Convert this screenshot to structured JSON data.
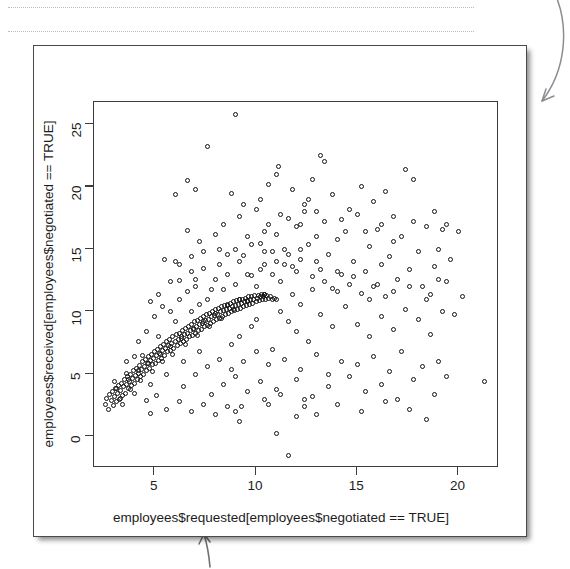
{
  "page": {
    "background": "#ffffff",
    "decorations": {
      "dotted_rules": 2,
      "arrow_top_right": "curved-arrow-pointing-down-left",
      "arrow_bottom": "arrow-pointing-up"
    }
  },
  "figure": {
    "card_border_color": "#4a4a4a",
    "plot_frame_color": "#3c3c3c",
    "point_color": "#111111"
  },
  "chart_data": {
    "type": "scatter",
    "title": "",
    "xlabel": "employees$requested[employees$negotiated == TRUE]",
    "ylabel": "employees$received[employees$negotiated == TRUE]",
    "grid": false,
    "legend": null,
    "xlim": [
      2.0,
      22.0
    ],
    "ylim": [
      -2.5,
      26.8
    ],
    "xticks": [
      5,
      10,
      15,
      20
    ],
    "yticks": [
      0,
      5,
      10,
      15,
      20,
      25
    ],
    "xtick_labels": [
      "5",
      "10",
      "15",
      "20"
    ],
    "ytick_labels": [
      "0",
      "5",
      "10",
      "15",
      "20",
      "25"
    ],
    "marker": "open-circle",
    "marker_size_px": 5,
    "n_points": 430,
    "points": [
      [
        2.55,
        2.6
      ],
      [
        2.62,
        3.1
      ],
      [
        2.7,
        2.2
      ],
      [
        2.78,
        3.4
      ],
      [
        2.85,
        2.9
      ],
      [
        2.9,
        3.6
      ],
      [
        2.95,
        2.5
      ],
      [
        3.0,
        3.2
      ],
      [
        3.05,
        3.9
      ],
      [
        3.1,
        2.8
      ],
      [
        3.15,
        3.5
      ],
      [
        3.2,
        4.1
      ],
      [
        3.25,
        3.0
      ],
      [
        3.3,
        3.7
      ],
      [
        3.35,
        4.3
      ],
      [
        3.4,
        3.3
      ],
      [
        3.45,
        4.0
      ],
      [
        3.5,
        4.6
      ],
      [
        3.55,
        3.5
      ],
      [
        3.6,
        4.2
      ],
      [
        3.65,
        4.8
      ],
      [
        3.7,
        3.9
      ],
      [
        3.75,
        4.4
      ],
      [
        3.8,
        5.0
      ],
      [
        3.85,
        4.1
      ],
      [
        3.9,
        4.7
      ],
      [
        3.95,
        5.3
      ],
      [
        4.0,
        4.3
      ],
      [
        4.05,
        4.9
      ],
      [
        4.1,
        5.5
      ],
      [
        4.15,
        4.6
      ],
      [
        4.2,
        5.1
      ],
      [
        4.25,
        5.7
      ],
      [
        4.3,
        4.8
      ],
      [
        4.35,
        5.4
      ],
      [
        4.4,
        6.0
      ],
      [
        4.45,
        5.0
      ],
      [
        4.5,
        5.6
      ],
      [
        4.55,
        6.2
      ],
      [
        4.6,
        5.3
      ],
      [
        4.65,
        5.9
      ],
      [
        4.7,
        6.4
      ],
      [
        4.75,
        5.5
      ],
      [
        4.8,
        6.1
      ],
      [
        4.85,
        6.6
      ],
      [
        4.9,
        5.8
      ],
      [
        4.95,
        6.3
      ],
      [
        5.0,
        6.8
      ],
      [
        5.05,
        5.9
      ],
      [
        5.1,
        6.5
      ],
      [
        5.15,
        7.0
      ],
      [
        5.2,
        6.1
      ],
      [
        5.25,
        6.7
      ],
      [
        5.3,
        7.2
      ],
      [
        5.35,
        6.3
      ],
      [
        5.4,
        6.9
      ],
      [
        5.45,
        7.4
      ],
      [
        5.5,
        6.5
      ],
      [
        5.55,
        7.1
      ],
      [
        5.6,
        7.6
      ],
      [
        5.65,
        6.8
      ],
      [
        5.7,
        7.3
      ],
      [
        5.75,
        7.8
      ],
      [
        5.8,
        6.9
      ],
      [
        5.85,
        7.5
      ],
      [
        5.9,
        8.0
      ],
      [
        5.95,
        7.1
      ],
      [
        6.0,
        7.6
      ],
      [
        6.05,
        8.2
      ],
      [
        6.1,
        7.3
      ],
      [
        6.15,
        7.8
      ],
      [
        6.2,
        8.3
      ],
      [
        6.25,
        7.5
      ],
      [
        6.3,
        8.0
      ],
      [
        6.35,
        8.5
      ],
      [
        6.4,
        7.6
      ],
      [
        6.45,
        8.2
      ],
      [
        6.5,
        8.7
      ],
      [
        6.55,
        7.8
      ],
      [
        6.6,
        8.3
      ],
      [
        6.65,
        8.8
      ],
      [
        6.7,
        8.0
      ],
      [
        6.75,
        8.5
      ],
      [
        6.8,
        9.0
      ],
      [
        6.85,
        8.1
      ],
      [
        6.9,
        8.7
      ],
      [
        6.95,
        9.2
      ],
      [
        7.0,
        8.3
      ],
      [
        7.05,
        8.8
      ],
      [
        7.1,
        9.3
      ],
      [
        7.15,
        8.5
      ],
      [
        7.2,
        9.0
      ],
      [
        7.25,
        9.5
      ],
      [
        7.3,
        8.6
      ],
      [
        7.35,
        9.1
      ],
      [
        7.4,
        9.6
      ],
      [
        7.45,
        8.8
      ],
      [
        7.5,
        9.3
      ],
      [
        7.55,
        9.8
      ],
      [
        7.6,
        8.9
      ],
      [
        7.65,
        9.4
      ],
      [
        7.7,
        9.9
      ],
      [
        7.75,
        9.1
      ],
      [
        7.8,
        9.6
      ],
      [
        7.85,
        10.0
      ],
      [
        7.9,
        9.2
      ],
      [
        7.95,
        9.7
      ],
      [
        8.0,
        10.2
      ],
      [
        8.05,
        9.4
      ],
      [
        8.1,
        9.8
      ],
      [
        8.15,
        10.3
      ],
      [
        8.2,
        9.5
      ],
      [
        8.25,
        10.0
      ],
      [
        8.3,
        10.4
      ],
      [
        8.35,
        9.6
      ],
      [
        8.4,
        10.1
      ],
      [
        8.45,
        10.5
      ],
      [
        8.5,
        9.8
      ],
      [
        8.55,
        10.2
      ],
      [
        8.6,
        10.6
      ],
      [
        8.65,
        9.9
      ],
      [
        8.7,
        10.3
      ],
      [
        8.75,
        10.7
      ],
      [
        8.8,
        10.0
      ],
      [
        8.85,
        10.4
      ],
      [
        8.9,
        10.8
      ],
      [
        8.95,
        10.1
      ],
      [
        9.0,
        10.5
      ],
      [
        9.05,
        10.9
      ],
      [
        9.1,
        10.2
      ],
      [
        9.15,
        10.6
      ],
      [
        9.2,
        11.0
      ],
      [
        9.25,
        10.3
      ],
      [
        9.3,
        10.7
      ],
      [
        9.35,
        11.0
      ],
      [
        9.4,
        10.4
      ],
      [
        9.45,
        10.8
      ],
      [
        9.5,
        11.1
      ],
      [
        9.55,
        10.5
      ],
      [
        9.6,
        10.9
      ],
      [
        9.65,
        11.2
      ],
      [
        9.7,
        10.6
      ],
      [
        9.75,
        11.0
      ],
      [
        9.8,
        11.2
      ],
      [
        9.85,
        10.7
      ],
      [
        9.9,
        11.0
      ],
      [
        9.95,
        11.3
      ],
      [
        10.0,
        10.8
      ],
      [
        10.05,
        11.1
      ],
      [
        10.1,
        11.3
      ],
      [
        10.15,
        10.9
      ],
      [
        10.2,
        11.2
      ],
      [
        10.25,
        11.4
      ],
      [
        10.3,
        11.0
      ],
      [
        10.35,
        11.2
      ],
      [
        10.4,
        11.4
      ],
      [
        10.45,
        11.0
      ],
      [
        10.5,
        11.3
      ],
      [
        10.6,
        11.1
      ],
      [
        10.7,
        11.2
      ],
      [
        10.8,
        11.0
      ],
      [
        10.9,
        11.1
      ],
      [
        11.0,
        11.0
      ],
      [
        3.0,
        4.4
      ],
      [
        3.4,
        2.6
      ],
      [
        3.6,
        5.1
      ],
      [
        4.0,
        3.5
      ],
      [
        4.4,
        6.5
      ],
      [
        4.8,
        4.2
      ],
      [
        5.2,
        8.0
      ],
      [
        5.6,
        5.0
      ],
      [
        6.0,
        9.2
      ],
      [
        6.4,
        6.0
      ],
      [
        6.8,
        10.0
      ],
      [
        7.2,
        6.8
      ],
      [
        3.3,
        3.1
      ],
      [
        3.8,
        3.8
      ],
      [
        4.3,
        4.5
      ],
      [
        4.9,
        5.2
      ],
      [
        5.4,
        6.0
      ],
      [
        5.9,
        6.6
      ],
      [
        6.5,
        7.4
      ],
      [
        7.1,
        8.1
      ],
      [
        7.7,
        8.8
      ],
      [
        8.3,
        9.5
      ],
      [
        8.9,
        10.2
      ],
      [
        9.6,
        10.8
      ],
      [
        3.1,
        3.9
      ],
      [
        3.7,
        4.6
      ],
      [
        4.2,
        5.3
      ],
      [
        4.7,
        5.9
      ],
      [
        5.3,
        6.6
      ],
      [
        5.8,
        7.2
      ],
      [
        6.3,
        7.9
      ],
      [
        6.9,
        8.6
      ],
      [
        7.4,
        9.2
      ],
      [
        8.0,
        9.9
      ],
      [
        8.6,
        10.5
      ],
      [
        9.2,
        11.0
      ],
      [
        4.6,
        2.9
      ],
      [
        5.1,
        3.3
      ],
      [
        9.0,
        2.0
      ],
      [
        9.3,
        2.4
      ],
      [
        11.0,
        0.3
      ],
      [
        11.6,
        -1.5
      ],
      [
        12.0,
        1.6
      ],
      [
        10.6,
        2.6
      ],
      [
        11.2,
        3.4
      ],
      [
        12.4,
        3.0
      ],
      [
        4.8,
        1.9
      ],
      [
        5.5,
        14.2
      ],
      [
        6.2,
        12.5
      ],
      [
        6.0,
        14.0
      ],
      [
        6.6,
        16.5
      ],
      [
        7.0,
        12.0
      ],
      [
        7.4,
        13.5
      ],
      [
        7.8,
        11.8
      ],
      [
        8.2,
        15.0
      ],
      [
        8.6,
        13.0
      ],
      [
        9.0,
        25.8
      ],
      [
        9.2,
        17.6
      ],
      [
        9.4,
        14.5
      ],
      [
        8.8,
        19.5
      ],
      [
        9.6,
        16.0
      ],
      [
        9.8,
        12.9
      ],
      [
        10.0,
        18.2
      ],
      [
        10.2,
        15.5
      ],
      [
        10.4,
        13.8
      ],
      [
        10.6,
        17.0
      ],
      [
        10.8,
        14.8
      ],
      [
        11.0,
        16.2
      ],
      [
        11.2,
        12.4
      ],
      [
        11.4,
        15.0
      ],
      [
        11.6,
        17.5
      ],
      [
        11.8,
        13.6
      ],
      [
        12.0,
        16.8
      ],
      [
        12.2,
        14.2
      ],
      [
        12.4,
        18.0
      ],
      [
        12.6,
        15.4
      ],
      [
        12.8,
        12.8
      ],
      [
        13.0,
        16.0
      ],
      [
        13.2,
        13.4
      ],
      [
        13.4,
        17.2
      ],
      [
        13.6,
        14.6
      ],
      [
        13.8,
        11.9
      ],
      [
        14.0,
        15.8
      ],
      [
        14.2,
        13.0
      ],
      [
        14.4,
        16.4
      ],
      [
        14.6,
        12.2
      ],
      [
        14.8,
        14.0
      ],
      [
        15.0,
        17.8
      ],
      [
        15.2,
        11.5
      ],
      [
        15.4,
        13.2
      ],
      [
        15.6,
        15.2
      ],
      [
        15.8,
        12.0
      ],
      [
        16.0,
        16.6
      ],
      [
        16.2,
        13.8
      ],
      [
        16.4,
        11.2
      ],
      [
        16.6,
        14.4
      ],
      [
        16.8,
        15.6
      ],
      [
        17.0,
        12.6
      ],
      [
        17.2,
        16.0
      ],
      [
        17.4,
        21.4
      ],
      [
        17.6,
        13.4
      ],
      [
        17.8,
        20.6
      ],
      [
        18.0,
        14.8
      ],
      [
        18.2,
        12.0
      ],
      [
        18.4,
        16.8
      ],
      [
        18.6,
        11.4
      ],
      [
        18.8,
        13.6
      ],
      [
        19.0,
        15.0
      ],
      [
        19.2,
        16.6
      ],
      [
        19.4,
        12.4
      ],
      [
        21.3,
        4.4
      ],
      [
        13.2,
        22.5
      ],
      [
        13.4,
        22.0
      ],
      [
        11.0,
        21.0
      ],
      [
        11.1,
        21.6
      ],
      [
        7.6,
        23.2
      ],
      [
        6.6,
        20.5
      ],
      [
        6.0,
        19.4
      ],
      [
        7.0,
        19.8
      ],
      [
        10.6,
        20.2
      ],
      [
        12.4,
        18.6
      ],
      [
        12.6,
        19.0
      ],
      [
        16.4,
        19.6
      ],
      [
        15.8,
        18.8
      ],
      [
        15.2,
        20.0
      ],
      [
        8.4,
        17.0
      ],
      [
        8.0,
        16.2
      ],
      [
        7.2,
        15.6
      ],
      [
        6.8,
        14.4
      ],
      [
        9.4,
        18.6
      ],
      [
        9.0,
        15.0
      ],
      [
        10.2,
        19.0
      ],
      [
        10.0,
        12.0
      ],
      [
        10.4,
        11.4
      ],
      [
        11.2,
        10.0
      ],
      [
        11.6,
        9.2
      ],
      [
        12.0,
        8.4
      ],
      [
        12.6,
        7.6
      ],
      [
        13.2,
        9.8
      ],
      [
        13.8,
        8.8
      ],
      [
        14.4,
        10.4
      ],
      [
        15.0,
        9.0
      ],
      [
        15.6,
        8.0
      ],
      [
        16.2,
        9.6
      ],
      [
        16.8,
        8.6
      ],
      [
        17.4,
        10.2
      ],
      [
        18.0,
        9.4
      ],
      [
        18.6,
        8.2
      ],
      [
        19.2,
        10.0
      ],
      [
        10.8,
        7.0
      ],
      [
        11.4,
        6.2
      ],
      [
        12.2,
        5.4
      ],
      [
        13.0,
        6.6
      ],
      [
        13.6,
        5.0
      ],
      [
        14.2,
        6.0
      ],
      [
        15.0,
        5.8
      ],
      [
        15.8,
        6.4
      ],
      [
        16.6,
        5.2
      ],
      [
        17.2,
        6.8
      ],
      [
        18.2,
        5.6
      ],
      [
        19.0,
        6.0
      ],
      [
        10.2,
        4.4
      ],
      [
        11.0,
        3.8
      ],
      [
        12.0,
        4.6
      ],
      [
        12.8,
        3.2
      ],
      [
        13.6,
        4.0
      ],
      [
        14.6,
        4.8
      ],
      [
        15.4,
        3.6
      ],
      [
        16.2,
        4.2
      ],
      [
        17.0,
        3.0
      ],
      [
        17.8,
        4.6
      ],
      [
        18.8,
        3.4
      ],
      [
        19.4,
        4.8
      ],
      [
        12.4,
        2.4
      ],
      [
        13.0,
        1.8
      ],
      [
        14.0,
        2.6
      ],
      [
        15.2,
        2.0
      ],
      [
        16.4,
        2.8
      ],
      [
        17.6,
        2.2
      ],
      [
        18.4,
        1.4
      ],
      [
        9.8,
        8.8
      ],
      [
        10.0,
        9.4
      ],
      [
        9.2,
        8.0
      ],
      [
        8.8,
        7.4
      ],
      [
        11.8,
        11.4
      ],
      [
        12.2,
        10.6
      ],
      [
        12.8,
        11.8
      ],
      [
        13.4,
        12.4
      ],
      [
        14.0,
        11.6
      ],
      [
        14.8,
        12.8
      ],
      [
        15.6,
        11.0
      ],
      [
        16.0,
        12.2
      ],
      [
        16.8,
        11.6
      ],
      [
        17.6,
        12.0
      ],
      [
        18.4,
        11.0
      ],
      [
        19.0,
        12.6
      ],
      [
        12.0,
        13.2
      ],
      [
        11.4,
        13.8
      ],
      [
        10.8,
        13.0
      ],
      [
        10.2,
        13.4
      ],
      [
        9.6,
        13.0
      ],
      [
        9.0,
        12.2
      ],
      [
        8.4,
        11.8
      ],
      [
        8.0,
        12.6
      ],
      [
        7.6,
        11.0
      ],
      [
        7.2,
        10.6
      ],
      [
        11.6,
        14.6
      ],
      [
        12.2,
        15.0
      ],
      [
        11.0,
        14.0
      ],
      [
        10.4,
        14.8
      ],
      [
        9.8,
        15.4
      ],
      [
        9.2,
        14.0
      ],
      [
        8.6,
        14.6
      ],
      [
        8.2,
        13.8
      ],
      [
        13.0,
        14.0
      ],
      [
        14.0,
        13.2
      ],
      [
        5.0,
        9.6
      ],
      [
        5.4,
        10.4
      ],
      [
        4.6,
        8.4
      ],
      [
        4.2,
        7.6
      ],
      [
        6.2,
        11.0
      ],
      [
        6.6,
        11.6
      ],
      [
        7.0,
        12.6
      ],
      [
        5.8,
        10.0
      ],
      [
        4.0,
        6.4
      ],
      [
        3.6,
        6.0
      ],
      [
        6.4,
        4.0
      ],
      [
        7.0,
        5.0
      ],
      [
        7.6,
        5.6
      ],
      [
        8.2,
        6.2
      ],
      [
        8.8,
        5.4
      ],
      [
        9.4,
        6.0
      ],
      [
        9.0,
        4.8
      ],
      [
        8.4,
        4.2
      ],
      [
        7.8,
        3.4
      ],
      [
        10.0,
        6.8
      ],
      [
        10.6,
        5.8
      ],
      [
        9.6,
        3.6
      ],
      [
        10.4,
        3.0
      ],
      [
        5.6,
        2.2
      ],
      [
        6.2,
        2.8
      ],
      [
        6.8,
        2.0
      ],
      [
        7.4,
        2.6
      ],
      [
        8.0,
        1.8
      ],
      [
        8.6,
        2.4
      ],
      [
        9.2,
        1.2
      ],
      [
        20.0,
        16.4
      ],
      [
        19.6,
        14.2
      ],
      [
        19.8,
        9.8
      ],
      [
        20.2,
        11.2
      ],
      [
        19.4,
        17.0
      ],
      [
        18.8,
        18.0
      ],
      [
        11.8,
        19.8
      ],
      [
        12.8,
        20.6
      ],
      [
        14.6,
        18.2
      ],
      [
        13.8,
        19.4
      ],
      [
        16.8,
        17.6
      ],
      [
        17.8,
        17.2
      ],
      [
        10.4,
        16.4
      ],
      [
        11.2,
        17.8
      ],
      [
        12.2,
        17.0
      ],
      [
        13.0,
        18.0
      ],
      [
        14.2,
        17.4
      ],
      [
        15.4,
        16.4
      ],
      [
        16.2,
        17.0
      ],
      [
        7.4,
        14.8
      ],
      [
        6.8,
        13.2
      ],
      [
        6.2,
        13.8
      ],
      [
        5.8,
        12.4
      ],
      [
        5.2,
        11.4
      ],
      [
        4.8,
        10.8
      ]
    ]
  }
}
